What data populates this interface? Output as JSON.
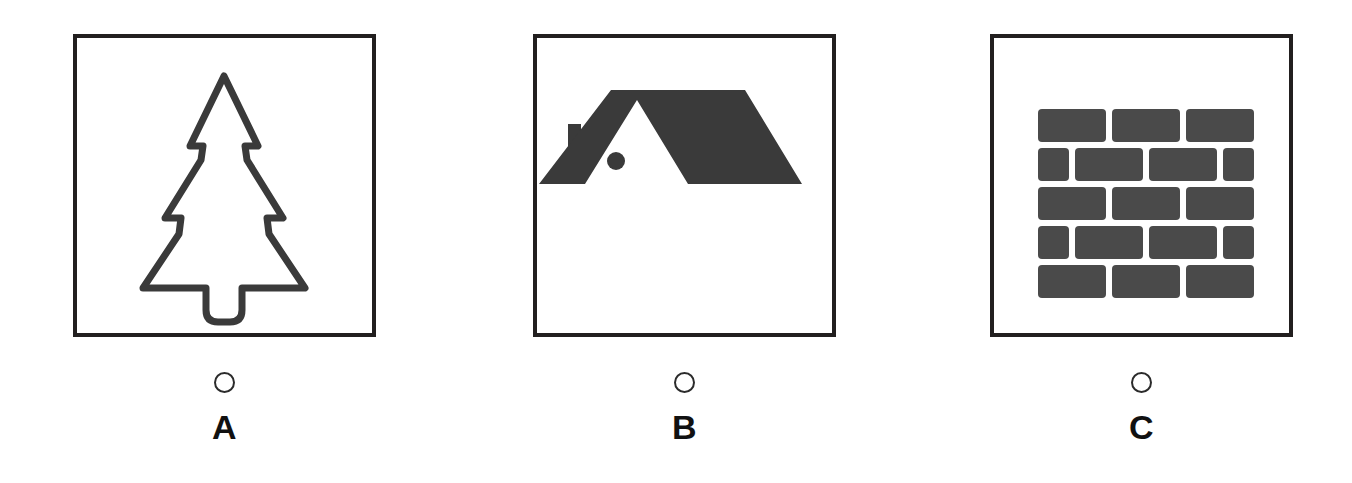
{
  "question": {
    "type": "multiple-choice-image",
    "options": [
      {
        "id": "A",
        "letter": "A",
        "selected": false,
        "image": {
          "name": "christmas-tree-outline-icon",
          "description": "Outlined evergreen / fir tree with trunk",
          "style": "outline",
          "stroke_color": "#3a3a3a",
          "fill_color": "#ffffff",
          "stroke_width": 7
        }
      },
      {
        "id": "B",
        "letter": "B",
        "selected": false,
        "image": {
          "name": "house-roof-icon",
          "description": "Solid silhouette of a house roof with chimney and round attic window",
          "style": "solid",
          "stroke_color": "#3a3a3a",
          "fill_color": "#3a3a3a",
          "stroke_width": 0
        }
      },
      {
        "id": "C",
        "letter": "C",
        "selected": false,
        "image": {
          "name": "brick-wall-icon",
          "description": "Brick wall pattern, 5 courses of staggered bricks",
          "style": "solid",
          "stroke_color": "#4a4a4a",
          "fill_color": "#4a4a4a",
          "stroke_width": 0,
          "rows": 5,
          "pattern": [
            "full-full-full",
            "half-full-full-half",
            "full-full-full",
            "half-full-full-half",
            "full-full-full"
          ]
        }
      }
    ]
  },
  "theme": {
    "background": "#ffffff",
    "frame_border": "#221f1f",
    "ink": "#111111",
    "radio_outline": "#2b2b2b",
    "icon_dark": "#3a3a3a",
    "brick_gray": "#4a4a4a"
  }
}
